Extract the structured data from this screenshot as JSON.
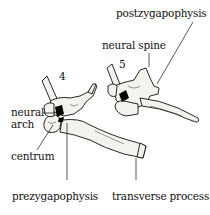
{
  "diagram": {
    "vertebrae": [
      {
        "number": "4"
      },
      {
        "number": "5"
      }
    ],
    "labels": {
      "postzygapophysis": "postzygapophysis",
      "neural_spine": "neural spine",
      "neural_arch_line1": "neural",
      "neural_arch_line2": "arch",
      "centrum": "centrum",
      "prezygapophysis": "prezygapophysis",
      "transverse_process": "transverse process"
    },
    "colors": {
      "ink": "#111111",
      "bone_fill": "#f4f2ec",
      "shadow": "#000000",
      "background": "#ffffff"
    }
  }
}
